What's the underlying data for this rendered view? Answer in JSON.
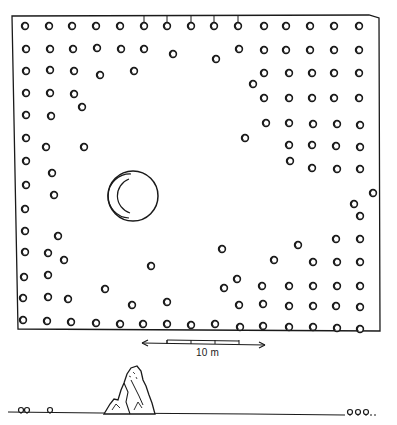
{
  "figure": {
    "type": "site-plan",
    "ink_color": "#1a1a1a",
    "paper_color": "#ffffff",
    "enclosure": {
      "border": {
        "x1": 12,
        "y1": 15,
        "x2": 379,
        "y2": 331
      },
      "tick_posts_top": [
        144,
        167,
        191,
        214,
        238
      ],
      "post_radius": 3.4
    },
    "posts": [
      [
        25,
        26
      ],
      [
        49,
        26
      ],
      [
        72,
        26
      ],
      [
        96,
        26
      ],
      [
        120,
        26
      ],
      [
        144,
        26
      ],
      [
        167,
        26
      ],
      [
        191,
        26
      ],
      [
        214,
        26
      ],
      [
        238,
        26
      ],
      [
        264,
        26
      ],
      [
        286,
        26
      ],
      [
        310,
        26
      ],
      [
        334,
        26
      ],
      [
        359,
        26
      ],
      [
        26,
        49
      ],
      [
        50,
        49
      ],
      [
        73,
        49
      ],
      [
        97,
        48
      ],
      [
        121,
        49
      ],
      [
        144,
        49
      ],
      [
        173,
        54
      ],
      [
        216,
        59
      ],
      [
        239,
        49
      ],
      [
        264,
        50
      ],
      [
        286,
        50
      ],
      [
        310,
        50
      ],
      [
        334,
        50
      ],
      [
        359,
        50
      ],
      [
        26,
        71
      ],
      [
        50,
        70
      ],
      [
        74,
        71
      ],
      [
        100,
        75
      ],
      [
        134,
        71
      ],
      [
        264,
        73
      ],
      [
        289,
        73
      ],
      [
        312,
        73
      ],
      [
        334,
        73
      ],
      [
        359,
        73
      ],
      [
        253,
        84
      ],
      [
        26,
        93
      ],
      [
        50,
        93
      ],
      [
        74,
        94
      ],
      [
        82,
        107
      ],
      [
        264,
        98
      ],
      [
        289,
        98
      ],
      [
        312,
        98
      ],
      [
        334,
        98
      ],
      [
        359,
        98
      ],
      [
        26,
        115
      ],
      [
        51,
        116
      ],
      [
        266,
        123
      ],
      [
        289,
        123
      ],
      [
        313,
        124
      ],
      [
        337,
        124
      ],
      [
        360,
        125
      ],
      [
        26,
        138
      ],
      [
        46,
        147
      ],
      [
        84,
        147
      ],
      [
        245,
        138
      ],
      [
        289,
        145
      ],
      [
        312,
        145
      ],
      [
        336,
        146
      ],
      [
        360,
        147
      ],
      [
        26,
        161
      ],
      [
        52,
        173
      ],
      [
        290,
        161
      ],
      [
        312,
        168
      ],
      [
        337,
        169
      ],
      [
        360,
        169
      ],
      [
        26,
        185
      ],
      [
        54,
        195
      ],
      [
        373,
        193
      ],
      [
        354,
        204
      ],
      [
        25,
        209
      ],
      [
        58,
        236
      ],
      [
        360,
        216
      ],
      [
        25,
        231
      ],
      [
        48,
        253
      ],
      [
        64,
        260
      ],
      [
        222,
        249
      ],
      [
        298,
        245
      ],
      [
        336,
        239
      ],
      [
        360,
        239
      ],
      [
        25,
        252
      ],
      [
        48,
        275
      ],
      [
        151,
        266
      ],
      [
        274,
        260
      ],
      [
        313,
        262
      ],
      [
        337,
        262
      ],
      [
        360,
        262
      ],
      [
        24,
        277
      ],
      [
        48,
        297
      ],
      [
        68,
        299
      ],
      [
        105,
        289
      ],
      [
        237,
        279
      ],
      [
        262,
        286
      ],
      [
        289,
        286
      ],
      [
        313,
        286
      ],
      [
        337,
        286
      ],
      [
        360,
        286
      ],
      [
        23,
        298
      ],
      [
        132,
        305
      ],
      [
        167,
        302
      ],
      [
        224,
        288
      ],
      [
        239,
        305
      ],
      [
        263,
        304
      ],
      [
        289,
        306
      ],
      [
        313,
        306
      ],
      [
        336,
        306
      ],
      [
        360,
        307
      ],
      [
        23,
        320
      ],
      [
        47,
        321
      ],
      [
        71,
        322
      ],
      [
        96,
        323
      ],
      [
        120,
        324
      ],
      [
        143,
        324
      ],
      [
        167,
        324
      ],
      [
        191,
        325
      ],
      [
        215,
        324
      ],
      [
        240,
        327
      ],
      [
        263,
        326
      ],
      [
        289,
        327
      ],
      [
        313,
        327
      ],
      [
        337,
        328
      ],
      [
        360,
        329
      ]
    ],
    "well": {
      "cx": 133,
      "cy": 196,
      "r": 25
    },
    "scale_bar": {
      "label": "10 m",
      "x1": 142,
      "x2": 265,
      "y": 343,
      "segments": [
        167,
        191,
        215,
        239
      ]
    },
    "profile": {
      "ground_y": 414,
      "outcrop_label": "rock-outcrop",
      "vegetation_left": [
        [
          24,
          410
        ],
        [
          50,
          410
        ]
      ],
      "vegetation_right": [
        [
          350,
          413
        ],
        [
          358,
          413
        ],
        [
          366,
          413
        ]
      ]
    }
  }
}
